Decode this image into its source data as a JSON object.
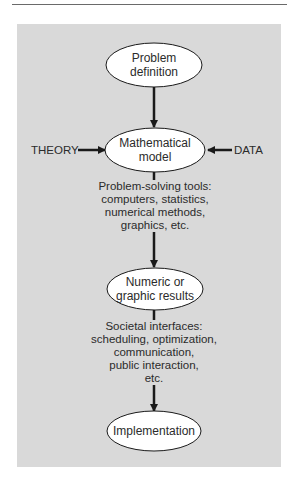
{
  "diagram": {
    "type": "flowchart",
    "colors": {
      "panel_background": "#d9d9d9",
      "node_fill": "#ffffff",
      "stroke": "#1a1a1a",
      "text": "#2b2b2b"
    },
    "nodes": [
      {
        "id": "problem-definition",
        "label_lines": [
          "Problem",
          "definition"
        ]
      },
      {
        "id": "mathematical-model",
        "label_lines": [
          "Mathematical",
          "model"
        ]
      },
      {
        "id": "numeric-results",
        "label_lines": [
          "Numeric or",
          "graphic results"
        ]
      },
      {
        "id": "implementation",
        "label_lines": [
          "Implementation"
        ]
      }
    ],
    "inputs": {
      "left": "THEORY",
      "right": "DATA"
    },
    "edges": [
      {
        "from": "problem-definition",
        "to": "mathematical-model",
        "label_lines": []
      },
      {
        "from": "mathematical-model",
        "to": "numeric-results",
        "label_lines": [
          "Problem-solving tools:",
          "computers, statistics,",
          "numerical methods,",
          "graphics, etc."
        ]
      },
      {
        "from": "numeric-results",
        "to": "implementation",
        "label_lines": [
          "Societal interfaces:",
          "scheduling, optimization,",
          "communication,",
          "public interaction,",
          "etc."
        ]
      }
    ]
  }
}
